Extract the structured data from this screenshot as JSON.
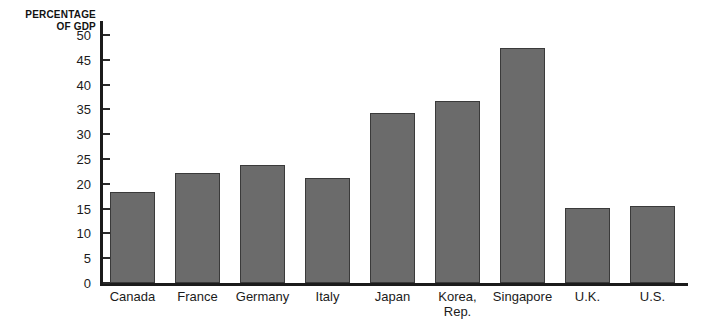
{
  "chart_data": {
    "type": "bar",
    "title": "",
    "subtitle": "",
    "xlabel": "",
    "ylabel": "PERCENTAGE OF GDP",
    "ylabel_line1": "PERCENTAGE",
    "ylabel_line2": "OF GDP",
    "ylim": [
      0,
      50
    ],
    "ytick_step": 5,
    "yticks": [
      0,
      5,
      10,
      15,
      20,
      25,
      30,
      35,
      40,
      45,
      50
    ],
    "ytick_labels": [
      "0",
      "5",
      "10",
      "15",
      "20",
      "25",
      "30",
      "35",
      "40",
      "45",
      "50"
    ],
    "grid": false,
    "legend": false,
    "legend_position": "none",
    "categories": [
      "Canada",
      "France",
      "Germany",
      "Italy",
      "Japan",
      "Korea, Rep.",
      "Singapore",
      "U.K.",
      "U.S."
    ],
    "category_lines": [
      [
        "Canada"
      ],
      [
        "France"
      ],
      [
        "Germany"
      ],
      [
        "Italy"
      ],
      [
        "Japan"
      ],
      [
        "Korea,",
        "Rep."
      ],
      [
        "Singapore"
      ],
      [
        "U.K."
      ],
      [
        "U.S."
      ]
    ],
    "values": [
      18.3,
      22.2,
      23.8,
      21.2,
      34.3,
      36.7,
      47.4,
      15.1,
      15.5
    ],
    "bar_color": "#6b6b6b",
    "bar_edge_color": "#3a3a3a",
    "axis_color": "#1b1b1b",
    "background_color": "#ffffff"
  }
}
